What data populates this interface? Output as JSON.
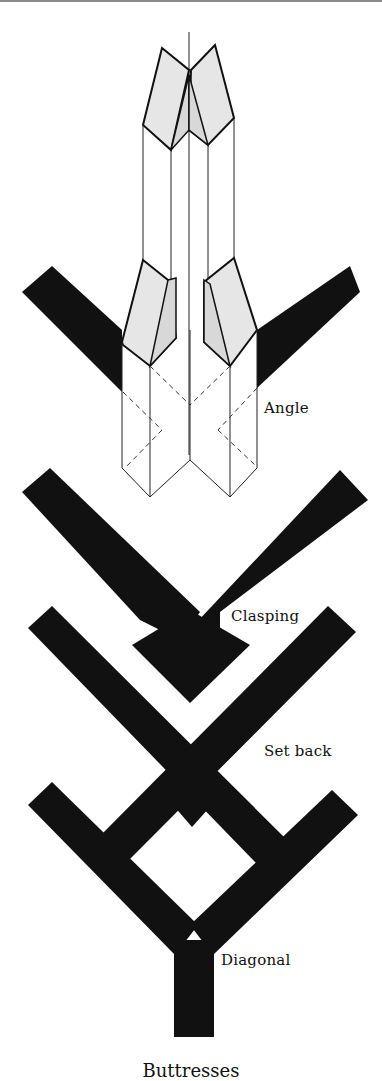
{
  "figure": {
    "caption": "Buttresses",
    "labels": {
      "angle": "Angle",
      "clasping": "Clasping",
      "set_back": "Set back",
      "diagonal": "Diagonal"
    },
    "colors": {
      "ink": "#111111",
      "paper": "#ffffff",
      "shade": "#e6e6e6"
    }
  }
}
